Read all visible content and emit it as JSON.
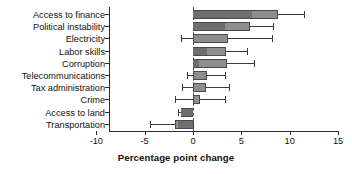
{
  "chart_data": {
    "type": "bar",
    "orientation": "horizontal",
    "title": "",
    "xlabel": "Percentage point change",
    "ylabel": "",
    "xlim": [
      -10,
      15
    ],
    "xticks": [
      -10,
      -5,
      0,
      5,
      10,
      15
    ],
    "xticklabels": [
      "-10",
      "-5",
      "0",
      "5",
      "10",
      "15"
    ],
    "grid": false,
    "legend": "none",
    "zero_reference_line": true,
    "categories": [
      "Access to finance",
      "Political instability",
      "Electricity",
      "Labor skills",
      "Corruption",
      "Telecommunications",
      "Tax administration",
      "Crime",
      "Access to land",
      "Transportation"
    ],
    "values": [
      8.8,
      5.9,
      3.6,
      3.4,
      3.5,
      1.4,
      1.3,
      0.7,
      -1.2,
      -1.9
    ],
    "error_low": [
      6.1,
      3.3,
      -1.2,
      1.4,
      0.6,
      -0.6,
      -1.1,
      -1.9,
      -1.6,
      -4.5
    ],
    "error_high": [
      11.5,
      8.3,
      8.2,
      5.6,
      6.3,
      3.3,
      3.7,
      3.3,
      -0.1,
      0.0
    ],
    "inner_marker": [
      6.1,
      3.3,
      0.0,
      1.4,
      0.6,
      0.0,
      0.0,
      0.0,
      -1.2,
      -1.6
    ],
    "series": [
      {
        "name": "Percentage point change",
        "values": [
          8.8,
          5.9,
          3.6,
          3.4,
          3.5,
          1.4,
          1.3,
          0.7,
          -1.2,
          -1.9
        ]
      }
    ],
    "colors": {
      "bar_fill": "#8e8e8e",
      "bar_edge": "#4a4a4a",
      "whisker": "#3a3a3a",
      "axis": "#2b2b2b",
      "zero_line": "#555555",
      "background": "#ffffff"
    }
  }
}
